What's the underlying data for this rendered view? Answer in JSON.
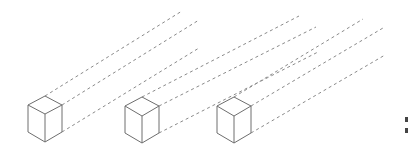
{
  "diagram": {
    "type": "isometric-cubes-with-projection-lines",
    "edge_color": "#6e6e6e",
    "projection_color": "#8a8a8a",
    "cubes": [
      {
        "id": "cube-1",
        "top": [
          45,
          96
        ],
        "left_top": [
          28,
          105
        ],
        "right_top": [
          62,
          105
        ],
        "center": [
          45,
          114
        ],
        "left_bottom": [
          28,
          132
        ],
        "right_bottom": [
          62,
          132
        ],
        "bottom": [
          45,
          142
        ],
        "projections": [
          {
            "from": [
              45,
              96
            ],
            "to": [
              182,
              11
            ]
          },
          {
            "from": [
              62,
              105
            ],
            "to": [
              199,
              20
            ]
          },
          {
            "from": [
              62,
              132
            ],
            "to": [
              199,
              48
            ]
          }
        ]
      },
      {
        "id": "cube-2",
        "top": [
          142,
          97
        ],
        "left_top": [
          125,
          106
        ],
        "right_top": [
          159,
          106
        ],
        "center": [
          142,
          116
        ],
        "left_bottom": [
          125,
          133
        ],
        "right_bottom": [
          159,
          133
        ],
        "bottom": [
          142,
          143
        ],
        "projections": [
          {
            "from": [
              142,
              97
            ],
            "to": [
              299,
              16
            ]
          },
          {
            "from": [
              159,
              106
            ],
            "to": [
              316,
              27
            ]
          },
          {
            "from": [
              159,
              133
            ],
            "to": [
              318,
              52
            ]
          }
        ]
      },
      {
        "id": "cube-3",
        "top": [
          234,
          97
        ],
        "left_top": [
          217,
          106
        ],
        "right_top": [
          251,
          106
        ],
        "center": [
          234,
          116
        ],
        "left_bottom": [
          217,
          133
        ],
        "right_bottom": [
          251,
          133
        ],
        "bottom": [
          234,
          143
        ],
        "projections": [
          {
            "from": [
              234,
              97
            ],
            "to": [
              363,
              19
            ]
          },
          {
            "from": [
              251,
              106
            ],
            "to": [
              383,
              28
            ]
          },
          {
            "from": [
              251,
              133
            ],
            "to": [
              385,
              55
            ]
          }
        ]
      }
    ],
    "edge_marks": [
      {
        "x": 405,
        "y": 117,
        "w": 3,
        "h": 5
      },
      {
        "x": 405,
        "y": 128,
        "w": 3,
        "h": 5
      }
    ]
  }
}
